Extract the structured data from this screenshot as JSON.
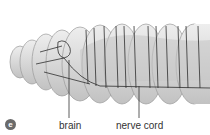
{
  "figure": {
    "panel_label": "e",
    "labels": [
      {
        "text": "brain",
        "x": 59,
        "y": 122
      },
      {
        "text": "nerve cord",
        "x": 116,
        "y": 122
      }
    ],
    "colors": {
      "body_fill": "#d6d6d6",
      "body_stroke": "#9a9a9a",
      "nerve": "#2e2e2e",
      "gut": "#c4c4c4",
      "badge": "#6a6a6a",
      "label_text": "#333333"
    }
  }
}
